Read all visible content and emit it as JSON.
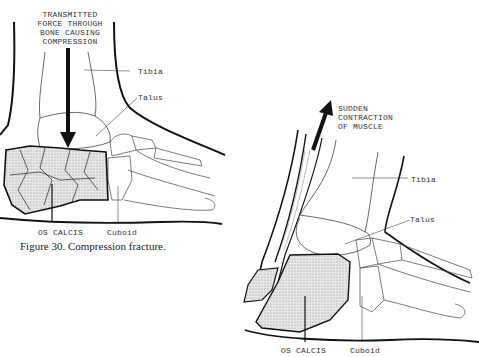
{
  "figure_left": {
    "annotation_force": "TRANSMITTED\nFORCE THROUGH\nBONE CAUSING\nCOMPRESSION",
    "labels": {
      "tibia": "Tibia",
      "talus": "Talus",
      "os_calcis": "OS CALCIS",
      "cuboid": "Cuboid"
    },
    "caption": "Figure 30.  Compression fracture."
  },
  "figure_right": {
    "annotation_muscle": "SUDDEN\nCONTRACTION\nOF MUSCLE",
    "labels": {
      "tibia": "Tibia",
      "talus": "Talus",
      "os_calcis": "OS CALCIS",
      "cuboid": "Cuboid"
    }
  },
  "colors": {
    "line": "#111111",
    "thin_line": "#555555",
    "stipple": "#d9d9d9",
    "background": "#ffffff"
  }
}
